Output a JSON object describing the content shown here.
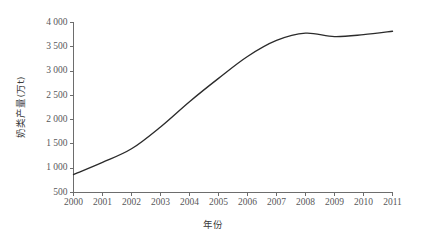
{
  "chart_data": {
    "type": "line",
    "title": "",
    "subtitle": "",
    "xlabel": "年份",
    "ylabel": "奶类产量(万t)",
    "x": [
      2000,
      2001,
      2002,
      2003,
      2004,
      2005,
      2006,
      2007,
      2008,
      2009,
      2010,
      2011
    ],
    "categories": [
      "2000",
      "2001",
      "2002",
      "2003",
      "2004",
      "2005",
      "2006",
      "2007",
      "2008",
      "2009",
      "2010",
      "2011"
    ],
    "values": [
      870,
      1120,
      1400,
      1850,
      2370,
      2850,
      3300,
      3630,
      3780,
      3710,
      3750,
      3820
    ],
    "series": [
      {
        "name": "奶类产量",
        "values": [
          870,
          1120,
          1400,
          1850,
          2370,
          2850,
          3300,
          3630,
          3780,
          3710,
          3750,
          3820
        ]
      }
    ],
    "xlim": [
      2000,
      2011
    ],
    "ylim": [
      500,
      4000
    ],
    "ytick_values": [
      500,
      1000,
      1500,
      2000,
      2500,
      3000,
      3500,
      4000
    ],
    "ytick_labels": [
      "500",
      "1 000",
      "1 500",
      "2 000",
      "2 500",
      "3 000",
      "3 500",
      "4 000"
    ],
    "xtick_labels": [
      "2000",
      "2001",
      "2002",
      "2003",
      "2004",
      "2005",
      "2006",
      "2007",
      "2008",
      "2009",
      "2010",
      "2011"
    ],
    "grid": false,
    "legend": false,
    "legend_position": "none",
    "line_color": "#2b2b2b",
    "axis_color": "#6d6d6d",
    "text_color": "#58585a",
    "background_color": "#ffffff"
  }
}
